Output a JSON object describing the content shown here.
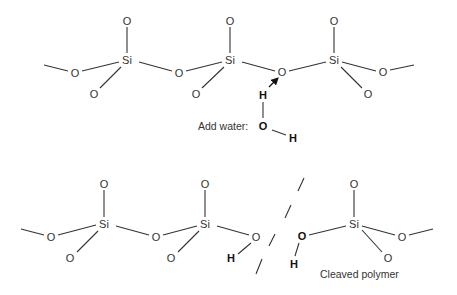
{
  "diagram": {
    "top_molecule": {
      "atoms": [
        {
          "id": "o_left",
          "label": "O",
          "x": 75,
          "y": 73
        },
        {
          "id": "si1",
          "label": "Si",
          "x": 127,
          "y": 60
        },
        {
          "id": "o_top1",
          "label": "O",
          "x": 127,
          "y": 21
        },
        {
          "id": "o_bot1",
          "label": "O",
          "x": 94,
          "y": 94
        },
        {
          "id": "o_bridge1",
          "label": "O",
          "x": 179,
          "y": 73
        },
        {
          "id": "si2",
          "label": "Si",
          "x": 230,
          "y": 60
        },
        {
          "id": "o_top2",
          "label": "O",
          "x": 230,
          "y": 21
        },
        {
          "id": "o_bot2",
          "label": "O",
          "x": 196,
          "y": 94
        },
        {
          "id": "o_bridge2",
          "label": "O",
          "x": 282,
          "y": 72
        },
        {
          "id": "si3",
          "label": "Si",
          "x": 334,
          "y": 60
        },
        {
          "id": "o_top3",
          "label": "O",
          "x": 334,
          "y": 21
        },
        {
          "id": "o_right",
          "label": "O",
          "x": 383,
          "y": 72
        },
        {
          "id": "o_bot3",
          "label": "O",
          "x": 368,
          "y": 94
        }
      ],
      "water": {
        "label": "Add water:",
        "h1": "H",
        "o": "O",
        "h2": "H"
      }
    },
    "bottom_molecule": {
      "atoms": [
        {
          "id": "b_o_left",
          "label": "O",
          "x": 51,
          "y": 237
        },
        {
          "id": "b_si1",
          "label": "Si",
          "x": 104,
          "y": 224
        },
        {
          "id": "b_o_top1",
          "label": "O",
          "x": 104,
          "y": 184
        },
        {
          "id": "b_o_bot1",
          "label": "O",
          "x": 70,
          "y": 258
        },
        {
          "id": "b_o_bridge1",
          "label": "O",
          "x": 156,
          "y": 237
        },
        {
          "id": "b_si2",
          "label": "Si",
          "x": 205,
          "y": 224
        },
        {
          "id": "b_o_top2",
          "label": "O",
          "x": 205,
          "y": 184
        },
        {
          "id": "b_o_bot2",
          "label": "O",
          "x": 171,
          "y": 258
        },
        {
          "id": "b_o_end",
          "label": "O",
          "x": 256,
          "y": 237
        },
        {
          "id": "b_si3",
          "label": "Si",
          "x": 354,
          "y": 224
        },
        {
          "id": "b_o_top3",
          "label": "O",
          "x": 354,
          "y": 184
        },
        {
          "id": "b_o_right",
          "label": "O",
          "x": 402,
          "y": 237
        },
        {
          "id": "b_o_bot3",
          "label": "O",
          "x": 388,
          "y": 258
        }
      ],
      "h_left": "H",
      "o_new": "O",
      "h_right": "H",
      "caption": "Cleaved polymer"
    }
  }
}
